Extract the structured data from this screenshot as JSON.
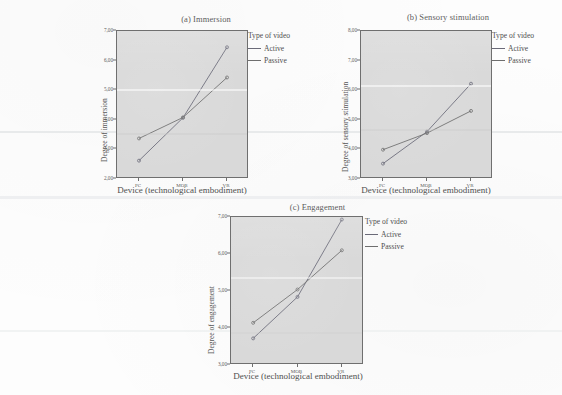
{
  "figure": {
    "legend_title": "Type of video",
    "series_names": [
      "Active",
      "Passive"
    ],
    "xlabel": "Device (technological embodiment)",
    "categories": [
      "PC",
      "MOB",
      "VR"
    ],
    "colors": {
      "active": "#6a6a78",
      "passive": "#6e6e6e",
      "plot_bg": "#d9d9d9",
      "axis": "#6f6f6f"
    }
  },
  "panels": [
    {
      "title": "(a) Immersion",
      "ylabel": "Degree of immersion",
      "yticks": [
        "7,00",
        "6,00",
        "5,00",
        "4,00",
        "3,00",
        "2,00"
      ]
    },
    {
      "title": "(b) Sensory stimulation",
      "ylabel": "Degree of sensory stimulation",
      "yticks": [
        "8,00",
        "7,00",
        "6,00",
        "5,00",
        "4,00",
        "3,00"
      ]
    },
    {
      "title": "(c) Engagement",
      "ylabel": "Degree of engagement",
      "yticks": [
        "7,00",
        "6,00",
        "5,00",
        "4,00",
        "3,00"
      ]
    }
  ],
  "chart_data": [
    {
      "type": "line",
      "title": "(a) Immersion",
      "xlabel": "Device (technological embodiment)",
      "ylabel": "Degree of immersion",
      "categories": [
        "PC",
        "MOB",
        "VR"
      ],
      "ylim": [
        2.0,
        7.0
      ],
      "yticks": [
        7.0,
        6.0,
        5.0,
        4.0,
        3.0,
        2.0
      ],
      "grid": false,
      "legend": "Type of video",
      "legend_position": "right",
      "series": [
        {
          "name": "Active",
          "values": [
            2.62,
            4.07,
            6.45
          ]
        },
        {
          "name": "Passive",
          "values": [
            3.37,
            4.08,
            5.43
          ]
        }
      ]
    },
    {
      "type": "line",
      "title": "(b) Sensory stimulation",
      "xlabel": "Device (technological embodiment)",
      "ylabel": "Degree of sensory stimulation",
      "categories": [
        "PC",
        "MOB",
        "VR"
      ],
      "ylim": [
        3.0,
        8.0
      ],
      "yticks": [
        8.0,
        7.0,
        6.0,
        5.0,
        4.0,
        3.0
      ],
      "grid": false,
      "legend": "Type of video",
      "legend_position": "right",
      "series": [
        {
          "name": "Active",
          "values": [
            3.52,
            4.6,
            6.22
          ]
        },
        {
          "name": "Passive",
          "values": [
            3.99,
            4.55,
            5.3
          ]
        }
      ]
    },
    {
      "type": "line",
      "title": "(c) Engagement",
      "xlabel": "Device (technological embodiment)",
      "ylabel": "Degree of engagement",
      "categories": [
        "PC",
        "MOB",
        "VR"
      ],
      "ylim": [
        3.0,
        7.0
      ],
      "yticks": [
        7.0,
        6.0,
        5.0,
        4.0,
        3.0
      ],
      "grid": false,
      "legend": "Type of video",
      "legend_position": "right",
      "series": [
        {
          "name": "Active",
          "values": [
            3.72,
            4.84,
            6.93
          ]
        },
        {
          "name": "Passive",
          "values": [
            4.14,
            5.04,
            6.1
          ]
        }
      ]
    }
  ]
}
